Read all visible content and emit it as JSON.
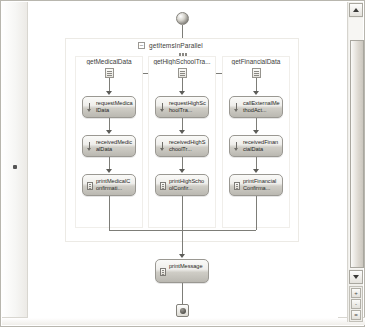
{
  "window": {
    "title": "Workflow Designer",
    "canvas_background": "#ffffff",
    "connector_color": "#7d7d78"
  },
  "scrollbar": {
    "up_arrow": "scroll-up",
    "down_arrow": "scroll-down",
    "mini_buttons": [
      "+",
      "-",
      "="
    ]
  },
  "workflow": {
    "start_node": "start-terminator",
    "end_node": "end-terminator",
    "parallel": {
      "label": "getItemsInParallel",
      "expander": "-",
      "icon": "parallel-icon"
    },
    "branches": [
      {
        "title": "getMedicalData",
        "icon": "sequence-icon",
        "activities": [
          {
            "label": "requestMedicalData",
            "icon": "send-activity-icon"
          },
          {
            "label": "receivedMedicalData",
            "icon": "receive-activity-icon"
          },
          {
            "label": "printMedicalConfirmati...",
            "icon": "code-activity-icon"
          }
        ]
      },
      {
        "title": "getHighSchoolTra...",
        "icon": "sequence-icon",
        "activities": [
          {
            "label": "requestHighSchoolTra...",
            "icon": "send-activity-icon"
          },
          {
            "label": "receivedHighSchoolTr...",
            "icon": "receive-activity-icon"
          },
          {
            "label": "printHighSchoolConfir...",
            "icon": "code-activity-icon"
          }
        ]
      },
      {
        "title": "getFinancialData",
        "icon": "sequence-icon",
        "activities": [
          {
            "label": "callExternalMethodAct...",
            "icon": "send-activity-icon"
          },
          {
            "label": "receivedFinancialData",
            "icon": "receive-activity-icon"
          },
          {
            "label": "printFinancialConfirma...",
            "icon": "code-activity-icon"
          }
        ]
      }
    ],
    "final_activity": {
      "label": "printMessage",
      "icon": "code-activity-icon"
    }
  }
}
